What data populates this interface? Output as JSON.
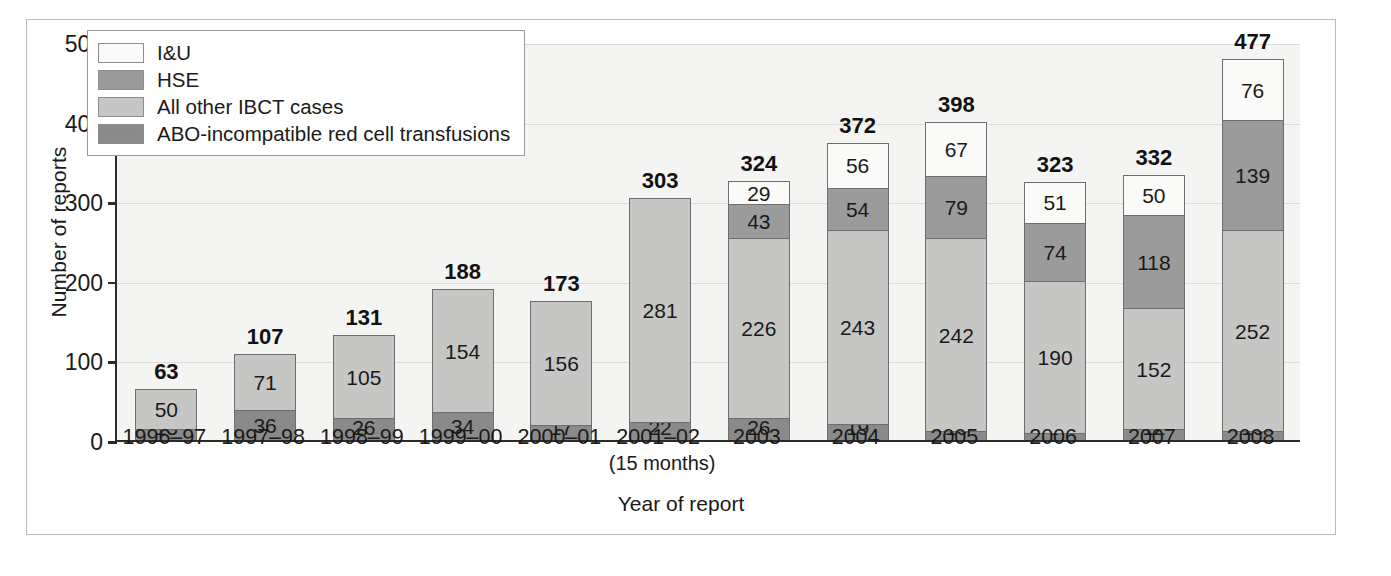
{
  "chart_data": {
    "type": "bar",
    "subtype": "stacked-bar",
    "title": "",
    "xlabel": "Year of report",
    "ylabel": "Number of reports",
    "ylim": [
      0,
      500
    ],
    "yticks": [
      0,
      100,
      200,
      300,
      400,
      500
    ],
    "grid": true,
    "legend_position": "top-left",
    "stack_order_bottom_to_top": [
      "ABO-incompatible red cell transfusions",
      "All other IBCT cases",
      "HSE",
      "I&U"
    ],
    "categories": [
      "1996–97",
      "1997–98",
      "1998–99",
      "1999–00",
      "2000–01",
      "2001–02",
      "2003",
      "2004",
      "2005",
      "2006",
      "2007",
      "2008"
    ],
    "category_sublabels": [
      "",
      "",
      "",
      "",
      "",
      "(15 months)",
      "",
      "",
      "",
      "",
      "",
      ""
    ],
    "series": [
      {
        "name": "I&U",
        "color": "#fafaf8",
        "values": [
          null,
          null,
          null,
          null,
          null,
          null,
          29,
          56,
          67,
          51,
          50,
          76
        ]
      },
      {
        "name": "HSE",
        "color": "#9b9b9b",
        "values": [
          null,
          null,
          null,
          null,
          null,
          null,
          43,
          54,
          79,
          74,
          118,
          139
        ]
      },
      {
        "name": "All other IBCT cases",
        "color": "#c6c6c4",
        "values": [
          50,
          71,
          105,
          154,
          156,
          281,
          226,
          243,
          242,
          190,
          152,
          252
        ]
      },
      {
        "name": "ABO-incompatible red cell transfusions",
        "color": "#8a8a8a",
        "values": [
          13,
          36,
          26,
          34,
          17,
          22,
          26,
          19,
          10,
          8,
          12,
          10
        ]
      }
    ],
    "totals": [
      63,
      107,
      131,
      188,
      173,
      303,
      324,
      372,
      398,
      323,
      332,
      477
    ]
  },
  "legend": {
    "items": [
      {
        "label": "I&U",
        "color": "#fafaf8"
      },
      {
        "label": "HSE",
        "color": "#9b9b9b"
      },
      {
        "label": "All other IBCT cases",
        "color": "#c6c6c4"
      },
      {
        "label": "ABO-incompatible red cell transfusions",
        "color": "#8a8a8a"
      }
    ]
  },
  "colors": {
    "plot_background": "#f4f4f2",
    "axis": "#2b2b2b",
    "gridline": "#dcdcd8",
    "frame_border": "#b9b9b9",
    "bar_outline": "#6e6e6e",
    "text": "#1a1a1a"
  }
}
